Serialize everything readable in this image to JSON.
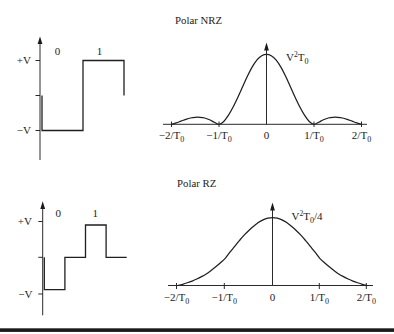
{
  "figure": {
    "panels": [
      {
        "title": "Polar NRZ"
      },
      {
        "title": "Polar RZ"
      }
    ],
    "colors": {
      "ink": "#222222",
      "background": "#ffffff",
      "rule": "#1a1a1a"
    }
  },
  "chart_data": [
    {
      "type": "line",
      "step": true,
      "panel": "Polar NRZ",
      "bit_labels": [
        "0",
        "1"
      ],
      "y_tick_labels": [
        "+V",
        "−V"
      ],
      "x_unit": "bit period",
      "y_unit": "V",
      "xlabel": "",
      "ylabel": "",
      "grid": false,
      "series": [
        {
          "x": [
            0,
            0,
            1,
            1,
            2,
            2
          ],
          "y": [
            0,
            -1,
            -1,
            1,
            1,
            0
          ]
        }
      ]
    },
    {
      "type": "line",
      "panel": "Polar NRZ",
      "title": "Polar NRZ",
      "peak_label": {
        "text": "V²T₀",
        "parts": [
          "V",
          "2",
          "T",
          "0"
        ]
      },
      "x_tick_labels": [
        {
          "text": "−2/T₀",
          "main": "−2/T",
          "sub": "0",
          "value": -2
        },
        {
          "text": "−1/T₀",
          "main": "−1/T",
          "sub": "0",
          "value": -1
        },
        {
          "text": "0",
          "main": "0",
          "sub": "",
          "value": 0
        },
        {
          "text": "1/T₀",
          "main": "1/T",
          "sub": "0",
          "value": 1
        },
        {
          "text": "2/T₀",
          "main": "2/T",
          "sub": "0",
          "value": 2
        }
      ],
      "xlabel": "",
      "ylabel": "",
      "xlim": [
        -2,
        2
      ],
      "ylim": [
        0,
        1
      ],
      "y_unit": "relative to peak (V²T₀)",
      "grid": false,
      "series": [
        {
          "x": [
            -2,
            -1.9,
            -1.8,
            -1.7,
            -1.6,
            -1.5,
            -1.4,
            -1.3,
            -1.2,
            -1.1,
            -1,
            -0.9,
            -0.8,
            -0.7,
            -0.6,
            -0.5,
            -0.4,
            -0.3,
            -0.2,
            -0.1,
            0,
            0.1,
            0.2,
            0.3,
            0.4,
            0.5,
            0.6,
            0.7,
            0.8,
            0.9,
            1,
            1.1,
            1.2,
            1.3,
            1.4,
            1.5,
            1.6,
            1.7,
            1.8,
            1.9,
            2
          ],
          "y": [
            0,
            0.02,
            0.045,
            0.07,
            0.09,
            0.1,
            0.1,
            0.09,
            0.065,
            0.03,
            0,
            0.04,
            0.13,
            0.25,
            0.39,
            0.54,
            0.69,
            0.82,
            0.92,
            0.98,
            1,
            0.98,
            0.92,
            0.82,
            0.69,
            0.54,
            0.39,
            0.25,
            0.13,
            0.04,
            0,
            0.03,
            0.065,
            0.09,
            0.1,
            0.1,
            0.09,
            0.07,
            0.045,
            0.02,
            0
          ]
        }
      ]
    },
    {
      "type": "line",
      "step": true,
      "panel": "Polar RZ",
      "bit_labels": [
        "0",
        "1"
      ],
      "y_tick_labels": [
        "+V",
        "−V"
      ],
      "x_unit": "bit period",
      "y_unit": "V",
      "xlabel": "",
      "ylabel": "",
      "grid": false,
      "series": [
        {
          "x": [
            0,
            0,
            0.5,
            0.5,
            1,
            1,
            1.5,
            1.5,
            2
          ],
          "y": [
            0,
            -1,
            -1,
            0,
            0,
            1,
            1,
            0,
            0
          ]
        }
      ]
    },
    {
      "type": "line",
      "panel": "Polar RZ",
      "title": "Polar RZ",
      "peak_label": {
        "text": "V²T₀/4",
        "parts": [
          "V",
          "2",
          "T",
          "0",
          "/4"
        ]
      },
      "x_tick_labels": [
        {
          "text": "−2/T₀",
          "main": "−2/T",
          "sub": "0",
          "value": -2
        },
        {
          "text": "−1/T₀",
          "main": "−1/T",
          "sub": "0",
          "value": -1
        },
        {
          "text": "0",
          "main": "0",
          "sub": "",
          "value": 0
        },
        {
          "text": "1/T₀",
          "main": "1/T",
          "sub": "0",
          "value": 1
        },
        {
          "text": "2/T₀",
          "main": "2/T",
          "sub": "0",
          "value": 2
        }
      ],
      "xlabel": "",
      "ylabel": "",
      "xlim": [
        -2,
        2
      ],
      "ylim": [
        0,
        1
      ],
      "y_unit": "relative to peak (V²T₀/4)",
      "grid": false,
      "series": [
        {
          "x": [
            -2,
            -1.9,
            -1.8,
            -1.7,
            -1.6,
            -1.5,
            -1.4,
            -1.3,
            -1.2,
            -1.1,
            -1,
            -0.9,
            -0.8,
            -0.7,
            -0.6,
            -0.5,
            -0.4,
            -0.3,
            -0.2,
            -0.1,
            0,
            0.1,
            0.2,
            0.3,
            0.4,
            0.5,
            0.6,
            0.7,
            0.8,
            0.9,
            1,
            1.1,
            1.2,
            1.3,
            1.4,
            1.5,
            1.6,
            1.7,
            1.8,
            1.9,
            2
          ],
          "y": [
            0,
            0.018,
            0.04,
            0.065,
            0.095,
            0.13,
            0.17,
            0.22,
            0.275,
            0.335,
            0.4,
            0.49,
            0.575,
            0.66,
            0.74,
            0.81,
            0.87,
            0.925,
            0.965,
            0.99,
            1,
            0.99,
            0.965,
            0.925,
            0.87,
            0.81,
            0.74,
            0.66,
            0.575,
            0.49,
            0.4,
            0.335,
            0.275,
            0.22,
            0.17,
            0.13,
            0.095,
            0.065,
            0.04,
            0.018,
            0
          ]
        }
      ]
    }
  ]
}
